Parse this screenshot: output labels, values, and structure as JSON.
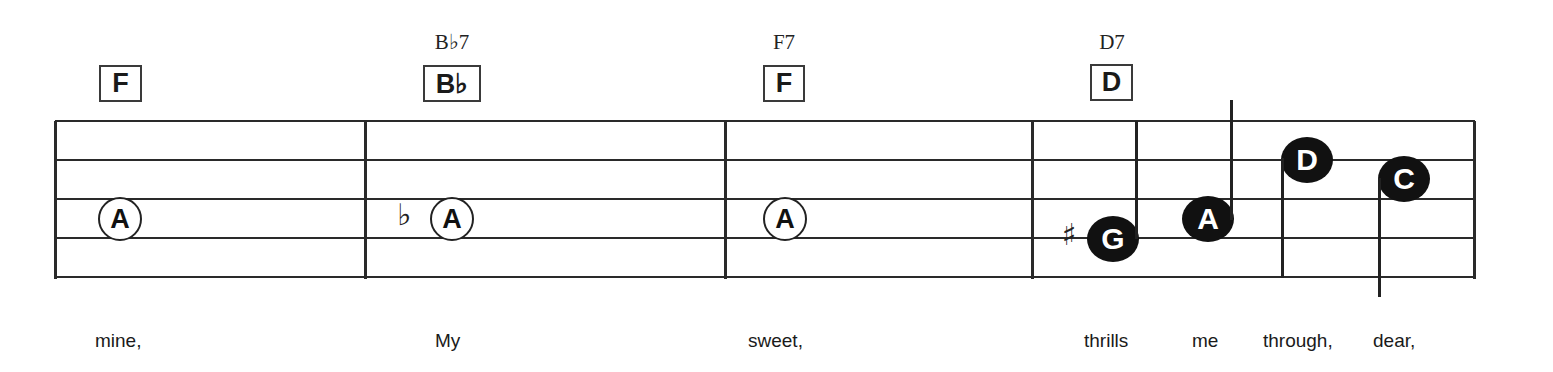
{
  "staff": {
    "line_count": 5,
    "color": "#2a2a2a"
  },
  "chords": [
    {
      "box": "F",
      "name": ""
    },
    {
      "box": "B♭",
      "name": "B♭7"
    },
    {
      "box": "F",
      "name": "F7"
    },
    {
      "box": "D",
      "name": "D7"
    }
  ],
  "notes": [
    {
      "letter": "A",
      "style": "open",
      "accidental": ""
    },
    {
      "letter": "A",
      "style": "open",
      "accidental": "♭"
    },
    {
      "letter": "A",
      "style": "open",
      "accidental": ""
    },
    {
      "letter": "G",
      "style": "filled",
      "accidental": "♯"
    },
    {
      "letter": "A",
      "style": "filled",
      "accidental": ""
    },
    {
      "letter": "D",
      "style": "filled",
      "accidental": ""
    },
    {
      "letter": "C",
      "style": "filled",
      "accidental": ""
    }
  ],
  "lyrics": [
    "mine,",
    "My",
    "sweet,",
    "thrills",
    "me",
    "through,",
    "dear,"
  ]
}
